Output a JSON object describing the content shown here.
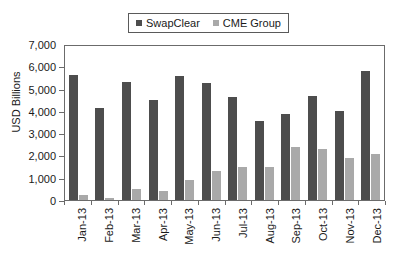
{
  "chart_data": {
    "type": "bar",
    "title": "",
    "subtitle": "",
    "xlabel": "",
    "ylabel": "USD Billions",
    "ylim": [
      0,
      7000
    ],
    "yticks": [
      "0",
      "1,000",
      "2,000",
      "3,000",
      "4,000",
      "5,000",
      "6,000",
      "7,000"
    ],
    "ytick_values": [
      0,
      1000,
      2000,
      3000,
      4000,
      5000,
      6000,
      7000
    ],
    "grid": false,
    "legend_position": "top-center",
    "categories": [
      "Jan-13",
      "Feb-13",
      "Mar-13",
      "Apr-13",
      "May-13",
      "Jun-13",
      "Jul-13",
      "Aug-13",
      "Sep-13",
      "Oct-13",
      "Nov-13",
      "Dec-13"
    ],
    "series": [
      {
        "name": "SwapClear",
        "color": "#4d4d4d",
        "values": [
          5700,
          4170,
          5370,
          4540,
          5630,
          5300,
          4690,
          3600,
          3900,
          4730,
          4060,
          5860
        ]
      },
      {
        "name": "CME Group",
        "color": "#a9a9a9",
        "values": [
          250,
          110,
          520,
          410,
          900,
          1320,
          1500,
          1500,
          2410,
          2340,
          1900,
          2100
        ]
      }
    ]
  },
  "legend": {
    "entries": [
      {
        "label": "SwapClear",
        "color": "#4d4d4d"
      },
      {
        "label": "CME Group",
        "color": "#a9a9a9"
      }
    ]
  }
}
